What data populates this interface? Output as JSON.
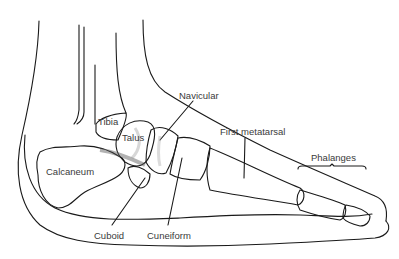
{
  "diagram": {
    "colors": {
      "line": "#1a1a1a",
      "label": "#3a3a3a",
      "shade": "#9a9a9a",
      "background": "#ffffff"
    },
    "labels": {
      "tibia": "Tibia",
      "talus": "Talus",
      "navicular": "Navicular",
      "first_metatarsal": "First metatarsal",
      "phalanges": "Phalanges",
      "calcaneum": "Calcaneum",
      "cuboid": "Cuboid",
      "cuneiform": "Cuneiform"
    }
  }
}
